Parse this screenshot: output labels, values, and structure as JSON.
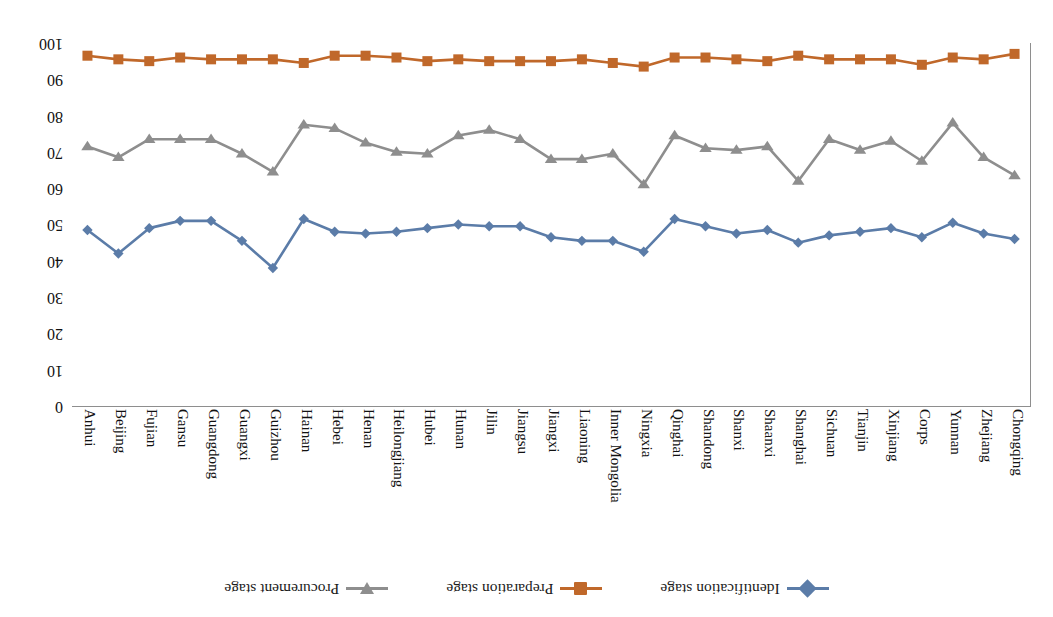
{
  "chart_data": {
    "type": "line",
    "title": "",
    "xlabel": "",
    "ylabel": "",
    "ylim": [
      0,
      100
    ],
    "yticks": [
      0,
      10,
      20,
      30,
      40,
      50,
      60,
      70,
      80,
      90,
      100
    ],
    "grid": false,
    "legend_position": "top",
    "orientation": "rotated-180",
    "categories": [
      "Chongqing",
      "Zhejiang",
      "Yunnan",
      "Corps",
      "Xinjiang",
      "Tianjin",
      "Sichuan",
      "Shanghai",
      "Shaanxi",
      "Shanxi",
      "Shandong",
      "Qinghai",
      "Ningxia",
      "Inner Mongolia",
      "Liaoning",
      "Jiangxi",
      "Jiangsu",
      "Jilin",
      "Hunan",
      "Hubei",
      "Heilongjiang",
      "Henan",
      "Hebei",
      "Hainan",
      "Guizhou",
      "Guangxi",
      "Guangdong",
      "Gansu",
      "Fujian",
      "Beijing",
      "Anhui"
    ],
    "series": [
      {
        "name": "Identification stage",
        "color": "#5B7CA8",
        "marker": "diamond",
        "values": [
          46,
          47.5,
          50.5,
          46.5,
          49,
          48,
          47,
          45,
          48.5,
          47.5,
          49.5,
          51.5,
          42.5,
          45.5,
          45.5,
          46.5,
          49.5,
          49.5,
          50,
          49,
          48,
          47.5,
          48,
          51.5,
          38,
          45.5,
          51,
          51,
          49,
          42,
          48.5
        ]
      },
      {
        "name": "Preparation stage",
        "color": "#C0682A",
        "marker": "square",
        "values": [
          97,
          95.5,
          96,
          94,
          95.5,
          95.5,
          95.5,
          96.5,
          95,
          95.5,
          96,
          96,
          93.5,
          94.5,
          95.5,
          95,
          95,
          95,
          95.5,
          95,
          96,
          96.5,
          96.5,
          94.5,
          95.5,
          95.5,
          95.5,
          96,
          95,
          95.5,
          96.5
        ]
      },
      {
        "name": "Procurement stage",
        "color": "#8E8E8E",
        "marker": "triangle-down",
        "values": [
          63.5,
          68.5,
          78,
          67.5,
          73,
          70.5,
          73.5,
          62,
          71.5,
          70.5,
          71,
          74.5,
          61,
          69.5,
          68,
          68,
          73.5,
          76,
          74.5,
          69.5,
          70,
          72.5,
          76.5,
          77.5,
          64.5,
          69.5,
          73.5,
          73.5,
          73.5,
          68.5,
          71.5
        ]
      }
    ]
  },
  "legend": {
    "items": [
      {
        "label": "Identification stage",
        "color": "#5B7CA8",
        "marker": "diamond"
      },
      {
        "label": "Preparation stage",
        "color": "#C0682A",
        "marker": "square"
      },
      {
        "label": "Procurement stage",
        "color": "#8E8E8E",
        "marker": "triangle-down"
      }
    ]
  }
}
